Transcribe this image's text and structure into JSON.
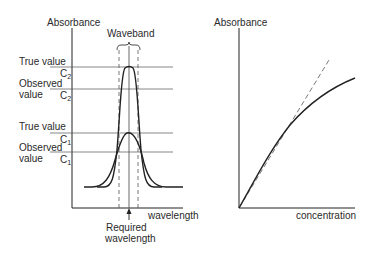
{
  "left_panel": {
    "y_axis_label": "Absorbance",
    "x_axis_label": "wavelength",
    "waveband_label": "Waveband",
    "required_wavelength_label_line1": "Required",
    "required_wavelength_label_line2": "wavelength",
    "c2_true_label": "True value",
    "c2_true_symbol": "C",
    "c2_true_sub": "2",
    "c2_observed_label_line1": "Observed",
    "c2_observed_label_line2": "value",
    "c2_observed_symbol": "C",
    "c2_observed_sub": "2",
    "c1_true_label": "True value",
    "c1_true_symbol": "C",
    "c1_true_sub": "1",
    "c1_observed_label_line1": "Observed",
    "c1_observed_label_line2": "value",
    "c1_observed_symbol": "C",
    "c1_observed_sub": "1"
  },
  "right_panel": {
    "y_axis_label": "Absorbance",
    "x_axis_label": "concentration"
  },
  "colors": {
    "line": "#222222",
    "guide": "#555555"
  }
}
